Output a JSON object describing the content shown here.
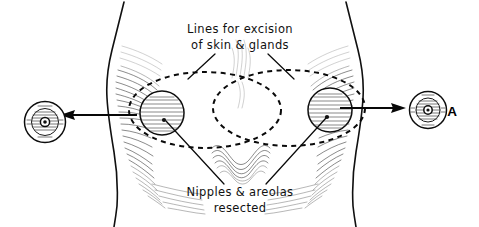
{
  "figure": {
    "panel_label": "A",
    "background_color": "#ffffff",
    "ink_color": "#101010",
    "dash_color": "#0a0a0a",
    "width": 479,
    "height": 227
  },
  "annotations": {
    "top_caption": {
      "name": "lines-for-excision",
      "line1": "Lines for excision",
      "line2": "of skin & glands"
    },
    "bottom_caption": {
      "name": "nipples-and-areolas-resected",
      "line1": "Nipples & areolas",
      "line2": "resected"
    }
  },
  "anatomy": {
    "torso": {
      "label": "female chest, frontal view",
      "left_edge_x": 108,
      "right_edge_x": 362,
      "midline_x": 240
    },
    "breasts": [
      {
        "side": "left",
        "areola_center_x": 162,
        "areola_center_y": 113,
        "areola_radius": 22,
        "excision_center_x": 205,
        "excision_center_y": 110,
        "excision_rx": 76,
        "excision_ry": 38
      },
      {
        "side": "right",
        "areola_center_x": 330,
        "areola_center_y": 110,
        "areola_radius": 22,
        "excision_center_x": 289,
        "excision_center_y": 108,
        "excision_rx": 76,
        "excision_ry": 38
      }
    ]
  },
  "insets": [
    {
      "name": "excised-nipple-specimen-left",
      "side": "left",
      "center_x": 45,
      "center_y": 122,
      "radius": 21,
      "arrow_direction": "left",
      "arrow_from_x": 137,
      "arrow_to_x": 62,
      "arrow_y": 115
    },
    {
      "name": "excised-nipple-specimen-right",
      "side": "right",
      "center_x": 428,
      "center_y": 110,
      "radius": 19,
      "arrow_direction": "right",
      "arrow_from_x": 340,
      "arrow_to_x": 406,
      "arrow_y": 108
    }
  ]
}
